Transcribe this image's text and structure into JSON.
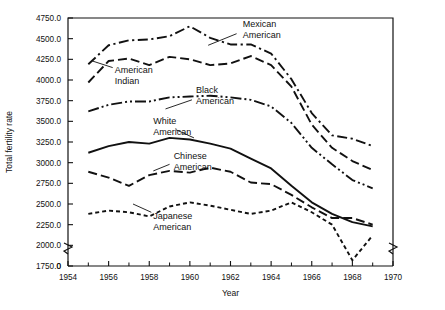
{
  "chart_data": {
    "type": "line",
    "title": "",
    "xlabel": "Year",
    "ylabel": "Total fertility rate",
    "xlim": [
      1954,
      1970
    ],
    "ylim": [
      1750,
      4750
    ],
    "y_axis_break": true,
    "y_axis_zero_label": "0",
    "grid": false,
    "legend": "inline-annotations",
    "x_tick_labels": [
      "1954",
      "1956",
      "1958",
      "1960",
      "1962",
      "1964",
      "1966",
      "1968",
      "1970"
    ],
    "x_tick_values": [
      1954,
      1956,
      1958,
      1960,
      1962,
      1964,
      1966,
      1968,
      1970
    ],
    "x_minor_ticks": [
      1955,
      1957,
      1959,
      1961,
      1963,
      1965,
      1967,
      1969
    ],
    "y_tick_labels": [
      "1750.0",
      "2000.0",
      "2250.0",
      "2500.0",
      "2750.0",
      "3000.0",
      "3250.0",
      "3500.0",
      "3750.0",
      "4000.0",
      "4250.0",
      "4500.0",
      "4750.0"
    ],
    "y_tick_values": [
      1750,
      2000,
      2250,
      2500,
      2750,
      3000,
      3250,
      3500,
      3750,
      4000,
      4250,
      4500,
      4750
    ],
    "x": [
      1955,
      1956,
      1957,
      1958,
      1959,
      1960,
      1961,
      1962,
      1963,
      1964,
      1965,
      1966,
      1967,
      1968,
      1969
    ],
    "series": [
      {
        "name": "Mexican American",
        "label": "Mexican\nAmerican",
        "dash": "dash-dot",
        "label_x": 1962.6,
        "label_y": 4640,
        "leader_from": [
          1962.3,
          4560
        ],
        "leader_to": [
          1960.9,
          4420
        ],
        "values": [
          4190,
          4420,
          4480,
          4490,
          4530,
          4650,
          4510,
          4430,
          4430,
          4320,
          4010,
          3600,
          3330,
          3290,
          3200
        ]
      },
      {
        "name": "American Indian",
        "label": "American\nIndian",
        "dash": "long-dash",
        "label_x": 1956.3,
        "label_y": 4080,
        "leader_from": [
          1956.2,
          4150
        ],
        "leader_to": [
          1955.2,
          4230
        ],
        "values": [
          3970,
          4230,
          4260,
          4180,
          4280,
          4250,
          4180,
          4200,
          4290,
          4180,
          3920,
          3460,
          3180,
          3020,
          2910
        ]
      },
      {
        "name": "Black American",
        "label": "Black\nAmerican",
        "dash": "dash-dot-dot",
        "label_x": 1960.3,
        "label_y": 3840,
        "leader_from": [
          1960.1,
          3760
        ],
        "leader_to": [
          1958.8,
          3650
        ],
        "values": [
          3620,
          3700,
          3740,
          3740,
          3790,
          3800,
          3810,
          3790,
          3760,
          3680,
          3480,
          3180,
          2980,
          2790,
          2690
        ]
      },
      {
        "name": "White American",
        "label": "White\nAmerican",
        "dash": "solid",
        "label_x": 1958.2,
        "label_y": 3470,
        "leader_from": [
          1959.3,
          3400
        ],
        "leader_to": [
          1960.2,
          3300
        ],
        "values": [
          3120,
          3200,
          3250,
          3230,
          3300,
          3280,
          3230,
          3170,
          3050,
          2930,
          2720,
          2520,
          2380,
          2280,
          2230
        ]
      },
      {
        "name": "Chinese American",
        "label": "Chinese\nAmerican",
        "dash": "long-dash",
        "label_x": 1959.2,
        "label_y": 3050,
        "leader_from": [
          1959.0,
          2980
        ],
        "leader_to": [
          1958.2,
          2900
        ],
        "values": [
          2890,
          2820,
          2720,
          2850,
          2900,
          2880,
          2940,
          2890,
          2760,
          2740,
          2610,
          2460,
          2330,
          2330,
          2250
        ]
      },
      {
        "name": "Japanese American",
        "label": "Japanese\nAmerican",
        "dash": "dotted-dash",
        "label_x": 1958.2,
        "label_y": 2320,
        "leader_from": [
          1958.1,
          2400
        ],
        "leader_to": [
          1957.2,
          2500
        ],
        "values": [
          2380,
          2420,
          2400,
          2350,
          2470,
          2520,
          2480,
          2430,
          2380,
          2420,
          2520,
          2400,
          2250,
          1820,
          2120
        ]
      }
    ]
  }
}
